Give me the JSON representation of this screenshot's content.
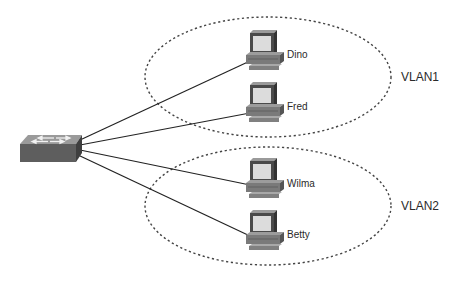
{
  "diagram": {
    "type": "network-topology",
    "switch": {
      "name": "switch",
      "x": 20,
      "y": 135
    },
    "vlans": [
      {
        "id": "vlan1",
        "label": "VLAN1",
        "cx": 268,
        "cy": 77,
        "rx": 123,
        "ry": 60,
        "label_x": 402,
        "label_y": 77
      },
      {
        "id": "vlan2",
        "label": "VLAN2",
        "cx": 268,
        "cy": 206,
        "rx": 123,
        "ry": 59,
        "label_x": 402,
        "label_y": 206
      }
    ],
    "hosts": [
      {
        "name": "Dino",
        "vlan": "VLAN1",
        "x": 244,
        "y": 30
      },
      {
        "name": "Fred",
        "vlan": "VLAN1",
        "x": 244,
        "y": 82
      },
      {
        "name": "Wilma",
        "vlan": "VLAN2",
        "x": 244,
        "y": 158
      },
      {
        "name": "Betty",
        "vlan": "VLAN2",
        "x": 244,
        "y": 210
      }
    ],
    "colors": {
      "line": "#222222",
      "ellipse": "#444444",
      "device_dark": "#5a5a5a",
      "device_mid": "#7d7d7d",
      "screen": "#d9d9d9"
    }
  }
}
